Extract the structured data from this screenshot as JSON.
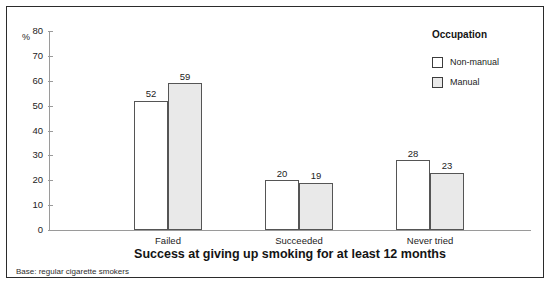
{
  "chart_data": {
    "type": "bar",
    "title": "Success at giving up smoking for at least 12 months",
    "subtitle": "",
    "xlabel": "",
    "ylabel": "%",
    "categories": [
      "Failed",
      "Succeeded",
      "Never tried"
    ],
    "series": [
      {
        "name": "Non-manual",
        "values": [
          52,
          20,
          28
        ],
        "fill": "#ffffff",
        "border": "#555555"
      },
      {
        "name": "Manual",
        "values": [
          59,
          19,
          23
        ],
        "fill": "#e9e9e9",
        "border": "#555555"
      }
    ],
    "ylim": [
      0,
      80
    ],
    "yticks": [
      0,
      10,
      20,
      30,
      40,
      50,
      60,
      70,
      80
    ],
    "ytick_labels": [
      "0",
      "10",
      "20",
      "30",
      "40",
      "50",
      "60",
      "70",
      "80"
    ],
    "grid": false,
    "legend_position": "right",
    "legend_title": "Occupation",
    "annotations": [
      "Base: regular cigarette smokers"
    ]
  },
  "figure": {
    "percent_symbol": "%",
    "footnote": "Base: regular cigarette smokers"
  },
  "legend": {
    "title": "Occupation",
    "items": [
      {
        "label": "Non-manual"
      },
      {
        "label": "Manual"
      }
    ]
  }
}
